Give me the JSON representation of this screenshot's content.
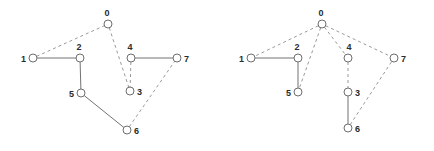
{
  "figure": {
    "title": "",
    "background_color": "#ffffff",
    "node_fill_color": "#ffffff",
    "node_stroke_color": "#6e6e6e",
    "solid_edge_color": "#737373",
    "dashed_edge_color": "#9a9a9a",
    "label_color": "#2b2b2b",
    "node_radius": 4
  },
  "graphs": [
    {
      "id": "left-graph",
      "name": "original-graph",
      "nodes": [
        {
          "id": "0",
          "label": "0",
          "x": 108,
          "y": 24,
          "label_dx": -1,
          "label_dy": -8,
          "label_anchor": "middle"
        },
        {
          "id": "1",
          "label": "1",
          "x": 33,
          "y": 58,
          "label_dx": -7,
          "label_dy": 4,
          "label_anchor": "end"
        },
        {
          "id": "2",
          "label": "2",
          "x": 80,
          "y": 58,
          "label_dx": -1,
          "label_dy": -8,
          "label_anchor": "middle"
        },
        {
          "id": "3",
          "label": "3",
          "x": 130,
          "y": 91,
          "label_dx": 7,
          "label_dy": 4,
          "label_anchor": "start"
        },
        {
          "id": "4",
          "label": "4",
          "x": 131,
          "y": 58,
          "label_dx": -1,
          "label_dy": -8,
          "label_anchor": "middle"
        },
        {
          "id": "5",
          "label": "5",
          "x": 81,
          "y": 93,
          "label_dx": -7,
          "label_dy": 4,
          "label_anchor": "end"
        },
        {
          "id": "6",
          "label": "6",
          "x": 127,
          "y": 130,
          "label_dx": 7,
          "label_dy": 4,
          "label_anchor": "start"
        },
        {
          "id": "7",
          "label": "7",
          "x": 177,
          "y": 58,
          "label_dx": 7,
          "label_dy": 4,
          "label_anchor": "start"
        }
      ],
      "edges": [
        {
          "from": "1",
          "to": "0",
          "style": "dashed"
        },
        {
          "from": "0",
          "to": "3",
          "style": "dashed"
        },
        {
          "from": "4",
          "to": "3",
          "style": "dashed"
        },
        {
          "from": "6",
          "to": "7",
          "style": "dashed"
        },
        {
          "from": "1",
          "to": "2",
          "style": "solid"
        },
        {
          "from": "2",
          "to": "5",
          "style": "solid"
        },
        {
          "from": "5",
          "to": "6",
          "style": "solid"
        },
        {
          "from": "4",
          "to": "7",
          "style": "solid"
        }
      ]
    },
    {
      "id": "right-graph",
      "name": "spanning-tree-graph",
      "nodes": [
        {
          "id": "0",
          "label": "0",
          "x": 322,
          "y": 24,
          "label_dx": -1,
          "label_dy": -8,
          "label_anchor": "middle"
        },
        {
          "id": "1",
          "label": "1",
          "x": 251,
          "y": 58,
          "label_dx": -7,
          "label_dy": 4,
          "label_anchor": "end"
        },
        {
          "id": "2",
          "label": "2",
          "x": 298,
          "y": 58,
          "label_dx": -1,
          "label_dy": -8,
          "label_anchor": "middle"
        },
        {
          "id": "3",
          "label": "3",
          "x": 348,
          "y": 92,
          "label_dx": 7,
          "label_dy": 4,
          "label_anchor": "start"
        },
        {
          "id": "4",
          "label": "4",
          "x": 348,
          "y": 58,
          "label_dx": 1,
          "label_dy": -8,
          "label_anchor": "middle"
        },
        {
          "id": "5",
          "label": "5",
          "x": 298,
          "y": 92,
          "label_dx": -7,
          "label_dy": 4,
          "label_anchor": "end"
        },
        {
          "id": "6",
          "label": "6",
          "x": 348,
          "y": 128,
          "label_dx": 7,
          "label_dy": 4,
          "label_anchor": "start"
        },
        {
          "id": "7",
          "label": "7",
          "x": 394,
          "y": 58,
          "label_dx": 7,
          "label_dy": 4,
          "label_anchor": "start"
        }
      ],
      "edges": [
        {
          "from": "0",
          "to": "1",
          "style": "dashed"
        },
        {
          "from": "0",
          "to": "5",
          "style": "dashed"
        },
        {
          "from": "0",
          "to": "4",
          "style": "dashed"
        },
        {
          "from": "0",
          "to": "7",
          "style": "dashed"
        },
        {
          "from": "4",
          "to": "3",
          "style": "dashed"
        },
        {
          "from": "6",
          "to": "7",
          "style": "dashed"
        },
        {
          "from": "1",
          "to": "2",
          "style": "solid"
        },
        {
          "from": "2",
          "to": "5",
          "style": "solid"
        },
        {
          "from": "3",
          "to": "6",
          "style": "solid"
        }
      ]
    }
  ]
}
